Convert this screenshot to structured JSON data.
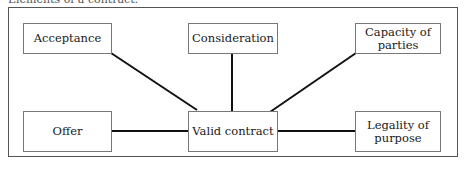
{
  "caption": "Elements of a contract:",
  "diagram": {
    "center": {
      "label": "Valid contract"
    },
    "nodes": [
      {
        "id": "acceptance",
        "label": "Acceptance"
      },
      {
        "id": "consideration",
        "label": "Consideration"
      },
      {
        "id": "capacity",
        "label": "Capacity of parties"
      },
      {
        "id": "offer",
        "label": "Offer"
      },
      {
        "id": "legality",
        "label": "Legality of purpose"
      }
    ],
    "edges": [
      [
        "acceptance",
        "center"
      ],
      [
        "consideration",
        "center"
      ],
      [
        "capacity",
        "center"
      ],
      [
        "offer",
        "center"
      ],
      [
        "center",
        "legality"
      ]
    ]
  }
}
